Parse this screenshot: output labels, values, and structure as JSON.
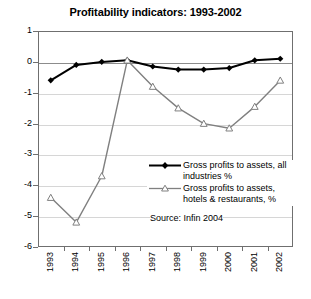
{
  "chart_data": {
    "type": "line",
    "title": "Profitability indicators: 1993-2002",
    "xlabel": "",
    "ylabel": "",
    "categories": [
      "1993",
      "1994",
      "1995",
      "1996",
      "1997",
      "1998",
      "1999",
      "2000",
      "2001",
      "2002"
    ],
    "ylim": [
      -6,
      1
    ],
    "yticks": [
      1,
      0,
      -1,
      -2,
      -3,
      -4,
      -5,
      -6
    ],
    "ytick_labels": [
      "1",
      "0",
      "-1",
      "-2",
      "-3",
      "-4",
      "-5",
      "-6"
    ],
    "grid": true,
    "legend_position": "inside-right",
    "series": [
      {
        "name": "Gross profits to assets, all industries %",
        "color": "#000000",
        "marker": "filled-diamond",
        "values": [
          -0.6,
          -0.1,
          0.0,
          0.05,
          -0.15,
          -0.25,
          -0.25,
          -0.2,
          0.05,
          0.1
        ]
      },
      {
        "name": "Gross profits to assets, hotels & restaurants, %",
        "color": "#808080",
        "marker": "open-triangle",
        "values": [
          -4.4,
          -5.2,
          -3.7,
          0.05,
          -0.8,
          -1.5,
          -2.0,
          -2.15,
          -1.45,
          -0.6
        ]
      }
    ],
    "annotations": [
      {
        "text": "Source: Infin 2004"
      }
    ]
  },
  "legend": {
    "entries": [
      {
        "line1": "Gross profits to assets, all",
        "line2": "industries %"
      },
      {
        "line1": "Gross profits to assets,",
        "line2": "hotels & restaurants, %"
      }
    ]
  },
  "source": {
    "text": "Source: Infin 2004"
  },
  "colors": {
    "series_all_industries": "#000000",
    "series_hotels": "#808080",
    "axis": "#6f6f6f",
    "grid": "#d6d6d6",
    "zero_line": "#8c8c8c",
    "background": "#ffffff"
  }
}
